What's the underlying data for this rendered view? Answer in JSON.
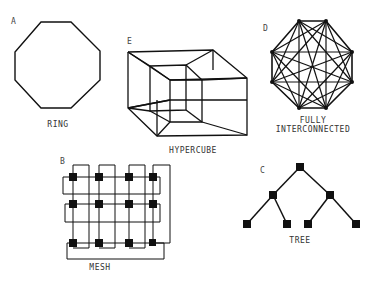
{
  "diagrams": {
    "ring": {
      "letter": "A",
      "label": "RING"
    },
    "hypercube": {
      "letter": "E",
      "label": "HYPERCUBE"
    },
    "fully": {
      "letter": "D",
      "label_line1": "FULLY",
      "label_line2": "INTERCONNECTED"
    },
    "mesh": {
      "letter": "B",
      "label": "MESH"
    },
    "tree": {
      "letter": "C",
      "label": "TREE"
    }
  },
  "colors": {
    "stroke": "#111111",
    "text": "#333333",
    "background": "#ffffff"
  }
}
